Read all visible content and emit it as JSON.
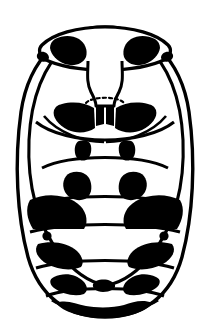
{
  "figure": {
    "domain_kind": "scientific-line-illustration",
    "caption": "",
    "background_color": "#ffffff",
    "ink_color": "#000000",
    "canvas": {
      "width": 209,
      "height": 336
    },
    "has_text_labels": false,
    "has_scale_bar": false
  },
  "anatomy": {
    "body_outline": {
      "name": "body-outline",
      "shape": "broad oval, widest just above mid-height, rounded at base",
      "extent": {
        "left": 22,
        "right": 190,
        "top": 26,
        "bottom": 316
      },
      "stroke_width": 3.2
    },
    "pronotum": {
      "name": "pronotum",
      "shape": "transverse crescent across the top of the body",
      "extent": {
        "left": 48,
        "right": 166,
        "top": 26,
        "bottom": 64
      },
      "markings": [
        {
          "name": "pronotum-spot-left",
          "cx": 72,
          "cy": 48,
          "size": "large irregular blotch"
        },
        {
          "name": "pronotum-spot-right",
          "cx": 142,
          "cy": 48,
          "size": "large irregular blotch"
        }
      ]
    },
    "head_plate": {
      "name": "head-plate",
      "shape": "narrow waisted plate descending from pronotum to scutellum",
      "extent": {
        "left": 84,
        "right": 128,
        "top": 56,
        "bottom": 104
      }
    },
    "scutellum": {
      "name": "scutellum",
      "shape": "small dashed/stippled arc below the head plate",
      "cx": 105,
      "cy": 100,
      "style": "dashed"
    },
    "elytra": [
      {
        "name": "elytron-left",
        "side": "left",
        "shape": "long curved wing-cover outline sweeping from shoulder to apex"
      },
      {
        "name": "elytron-right",
        "side": "right",
        "shape": "long curved wing-cover outline sweeping from shoulder to apex"
      }
    ],
    "abdominal_segments": [
      {
        "name": "segment-1",
        "index": 1,
        "band_y": 148,
        "blotch_pair": "very large, heavy, meeting near midline"
      },
      {
        "name": "segment-2",
        "index": 2,
        "band_y": 178,
        "blotch_pair": "small paired tabs near center"
      },
      {
        "name": "segment-3",
        "index": 3,
        "band_y": 208,
        "blotch_pair": "medium paired blotches"
      },
      {
        "name": "segment-4",
        "index": 4,
        "band_y": 240,
        "blotch_pair": "very large paired blotches reaching the margins"
      },
      {
        "name": "segment-5",
        "index": 5,
        "band_y": 272,
        "blotch_pair": "large paired blotches"
      },
      {
        "name": "segment-6",
        "index": 6,
        "band_y": 296,
        "blotch_pair": "paired blotches along the band"
      },
      {
        "name": "segment-7",
        "index": 7,
        "band_y": 314,
        "blotch_pair": "terminal dark band at apex"
      }
    ],
    "lateral_dots": [
      {
        "name": "lateral-dot-left",
        "cx": 47,
        "cy": 234,
        "r": 4.5
      },
      {
        "name": "lateral-dot-right",
        "cx": 166,
        "cy": 234,
        "r": 4.5
      }
    ]
  }
}
